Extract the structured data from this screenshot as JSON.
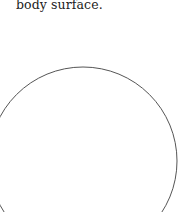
{
  "text": {
    "caption_tail": "body surface."
  },
  "figure": {
    "shape": "circle",
    "stroke_color": "#555555",
    "fill_color": "#ffffff"
  }
}
